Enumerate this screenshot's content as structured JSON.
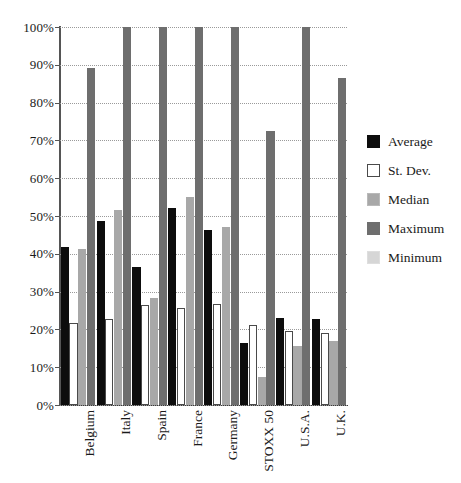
{
  "chart_data": {
    "type": "bar",
    "title": "",
    "xlabel": "",
    "ylabel": "",
    "ylim": [
      0,
      100
    ],
    "ytick_labels": [
      "100%",
      "90%",
      "80%",
      "70%",
      "60%",
      "50%",
      "40%",
      "30%",
      "20%",
      "10%",
      "0%"
    ],
    "ytick_values": [
      100,
      90,
      80,
      70,
      60,
      50,
      40,
      30,
      20,
      10,
      0
    ],
    "grid": true,
    "legend_position": "right",
    "value_unit": "percent",
    "categories": [
      "Belgium",
      "Italy",
      "Spain",
      "France",
      "Germany",
      "STOXX 50",
      "U.S.A.",
      "U.K."
    ],
    "series": [
      {
        "name": "Average",
        "color": "#0d0d0d",
        "values": [
          41.7,
          48.6,
          36.6,
          52.2,
          46.3,
          16.5,
          23.0,
          22.7
        ]
      },
      {
        "name": "St. Dev.",
        "color": "#ffffff",
        "values": [
          21.6,
          22.7,
          26.5,
          25.6,
          26.8,
          21.3,
          19.5,
          19.0
        ]
      },
      {
        "name": "Median",
        "color": "#a8a8a8",
        "values": [
          41.2,
          51.5,
          28.2,
          55.0,
          47.2,
          7.4,
          15.6,
          17.0
        ]
      },
      {
        "name": "Maximum",
        "color": "#6e6e6e",
        "values": [
          89.2,
          100.0,
          100.0,
          100.0,
          100.0,
          72.5,
          100.0,
          86.5
        ]
      },
      {
        "name": "Minimum",
        "color": "#d6d6d6",
        "values": [
          0,
          0,
          0,
          0,
          0,
          0,
          0,
          0
        ]
      }
    ]
  },
  "legend": {
    "items": [
      {
        "label": "Average",
        "swatch": "legend-swatch-average"
      },
      {
        "label": "St. Dev.",
        "swatch": "legend-swatch-st-dev"
      },
      {
        "label": "Median",
        "swatch": "legend-swatch-median"
      },
      {
        "label": "Maximum",
        "swatch": "legend-swatch-maximum"
      },
      {
        "label": "Minimum",
        "swatch": "legend-swatch-minimum"
      }
    ]
  },
  "colors": {
    "average": "#0d0d0d",
    "st_dev": "#ffffff",
    "median": "#a8a8a8",
    "maximum": "#6e6e6e",
    "minimum": "#d6d6d6",
    "axis": "#555555",
    "gridline": "#9a9a9a",
    "text": "#1a1a1a",
    "background": "#ffffff"
  }
}
